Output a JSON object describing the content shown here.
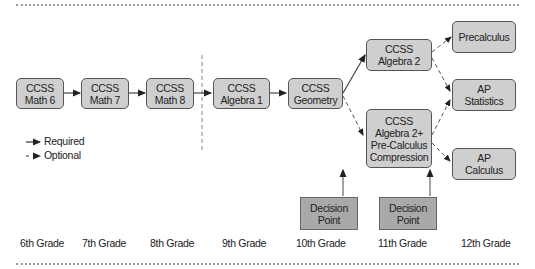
{
  "courses": [
    {
      "id": "math6",
      "lines": [
        "CCSS",
        "Math 6"
      ]
    },
    {
      "id": "math7",
      "lines": [
        "CCSS",
        "Math 7"
      ]
    },
    {
      "id": "math8",
      "lines": [
        "CCSS",
        "Math 8"
      ]
    },
    {
      "id": "algebra1",
      "lines": [
        "CCSS",
        "Algebra 1"
      ]
    },
    {
      "id": "geometry",
      "lines": [
        "CCSS",
        "Geometry"
      ]
    },
    {
      "id": "algebra2",
      "lines": [
        "CCSS",
        "Algebra 2"
      ]
    },
    {
      "id": "compression",
      "lines": [
        "CCSS",
        "Algebra 2+",
        "Pre-Calculus",
        "Compression"
      ]
    },
    {
      "id": "precalculus",
      "lines": [
        "Precalculus"
      ]
    },
    {
      "id": "ap_statistics",
      "lines": [
        "AP",
        "Statistics"
      ]
    },
    {
      "id": "ap_calculus",
      "lines": [
        "AP",
        "Calculus"
      ]
    }
  ],
  "decision_points": [
    {
      "lines": [
        "Decision",
        "Point"
      ]
    },
    {
      "lines": [
        "Decision",
        "Point"
      ]
    }
  ],
  "legend": {
    "required": "Required",
    "optional": "Optional"
  },
  "grades": [
    "6th Grade",
    "7th Grade",
    "8th Grade",
    "9th Grade",
    "10th Grade",
    "11th Grade",
    "12th Grade"
  ],
  "colors": {
    "course_fill": "#cfcfcf",
    "decision_fill": "#a9a9a9",
    "line": "#444444"
  }
}
